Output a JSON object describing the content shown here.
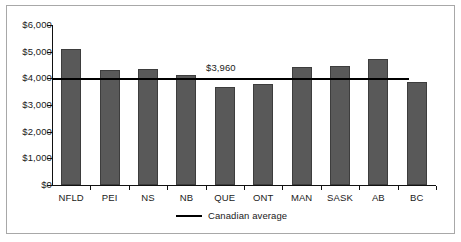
{
  "chart_data": {
    "type": "bar",
    "title": "",
    "subtitle": "",
    "xlabel": "",
    "ylabel": "",
    "categories": [
      "NFLD",
      "PEI",
      "NS",
      "NB",
      "QUE",
      "ONT",
      "MAN",
      "SASK",
      "AB",
      "BC"
    ],
    "values": [
      5100,
      4300,
      4350,
      4120,
      3680,
      3790,
      4420,
      4450,
      4720,
      3850
    ],
    "series": [
      {
        "name": "Provincial amount",
        "values": [
          5100,
          4300,
          4350,
          4120,
          3680,
          3790,
          4420,
          4450,
          4720,
          3850
        ],
        "color": "#595959"
      }
    ],
    "ylim": [
      0,
      6000
    ],
    "ytick_values": [
      0,
      1000,
      2000,
      3000,
      4000,
      5000,
      6000
    ],
    "ytick_labels": [
      "$0",
      "$1,000",
      "$2,000",
      "$3,000",
      "$4,000",
      "$5,000",
      "$6,000"
    ],
    "grid": false,
    "legend_position": "bottom",
    "reference_line": {
      "name": "Canadian average",
      "value": 3960,
      "label": "$3,960",
      "color": "#000000"
    },
    "legend": [
      {
        "label": "Canadian average",
        "marker": "line",
        "color": "#000000"
      }
    ]
  },
  "colors": {
    "bar_fill": "#595959",
    "bar_edge": "#3d3d3d",
    "axis": "#111111",
    "reference_line": "#000000",
    "frame": "#a8a8a8",
    "background": "#ffffff",
    "text": "#1a1a1a"
  }
}
